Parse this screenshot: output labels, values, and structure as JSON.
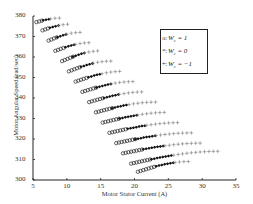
{
  "chart_data": {
    "type": "scatter",
    "title": "",
    "xlabel": "Motor Stator Current (A)",
    "ylabel": "Motor Angular Speed (rad/sec)",
    "xlim": [
      5,
      35
    ],
    "ylim": [
      300,
      380
    ],
    "xticks": [
      5,
      10,
      15,
      20,
      25,
      30,
      35
    ],
    "yticks": [
      300,
      310,
      320,
      330,
      340,
      350,
      360,
      370,
      380
    ],
    "grid": false,
    "legend_position": "upper right (inside)",
    "legend": [
      {
        "label": "W_c = 1",
        "marker": "circle-open"
      },
      {
        "label": "W_c = 0",
        "marker": "filled"
      },
      {
        "label": "W_c = -1",
        "marker": "plus"
      }
    ],
    "bands_note": "Each band = one speed level; points go left→right: circles (W_c=1), filled (W_c=0), plus (W_c=-1)",
    "bands": [
      {
        "y_start": 377,
        "x_start": 5.5,
        "circle": [
          5.5,
          6.5
        ],
        "filled": [
          6.5,
          7.6
        ],
        "plus": [
          7.6,
          9.0
        ],
        "rise": 2
      },
      {
        "y_start": 373,
        "x_start": 6.4,
        "circle": [
          6.4,
          7.5
        ],
        "filled": [
          7.5,
          8.8
        ],
        "plus": [
          8.8,
          10.5
        ],
        "rise": 3
      },
      {
        "y_start": 368,
        "x_start": 7.3,
        "circle": [
          7.3,
          8.6
        ],
        "filled": [
          8.6,
          10.0
        ],
        "plus": [
          10.0,
          12.0
        ],
        "rise": 4
      },
      {
        "y_start": 363,
        "x_start": 8.3,
        "circle": [
          8.3,
          9.8
        ],
        "filled": [
          9.8,
          11.3
        ],
        "plus": [
          11.3,
          13.5
        ],
        "rise": 4
      },
      {
        "y_start": 358,
        "x_start": 9.3,
        "circle": [
          9.3,
          10.9
        ],
        "filled": [
          10.9,
          12.6
        ],
        "plus": [
          12.6,
          15.0
        ],
        "rise": 5
      },
      {
        "y_start": 353,
        "x_start": 10.3,
        "circle": [
          10.3,
          12.1
        ],
        "filled": [
          12.1,
          13.9
        ],
        "plus": [
          13.9,
          16.5
        ],
        "rise": 5
      },
      {
        "y_start": 348,
        "x_start": 11.3,
        "circle": [
          11.3,
          13.2
        ],
        "filled": [
          13.2,
          15.2
        ],
        "plus": [
          15.2,
          18.2
        ],
        "rise": 5
      },
      {
        "y_start": 343,
        "x_start": 12.3,
        "circle": [
          12.3,
          14.4
        ],
        "filled": [
          14.4,
          16.5
        ],
        "plus": [
          16.5,
          19.8
        ],
        "rise": 5
      },
      {
        "y_start": 338,
        "x_start": 13.3,
        "circle": [
          13.3,
          15.5
        ],
        "filled": [
          15.5,
          17.8
        ],
        "plus": [
          17.8,
          21.5
        ],
        "rise": 5
      },
      {
        "y_start": 333,
        "x_start": 14.3,
        "circle": [
          14.3,
          16.7
        ],
        "filled": [
          16.7,
          19.2
        ],
        "plus": [
          19.2,
          23.2
        ],
        "rise": 5
      },
      {
        "y_start": 328,
        "x_start": 15.3,
        "circle": [
          15.3,
          17.8
        ],
        "filled": [
          17.8,
          20.5
        ],
        "plus": [
          20.5,
          25.0
        ],
        "rise": 5
      },
      {
        "y_start": 323,
        "x_start": 16.3,
        "circle": [
          16.3,
          19.0
        ],
        "filled": [
          19.0,
          21.8
        ],
        "plus": [
          21.8,
          26.8
        ],
        "rise": 5
      },
      {
        "y_start": 318,
        "x_start": 17.3,
        "circle": [
          17.3,
          20.1
        ],
        "filled": [
          20.1,
          23.2
        ],
        "plus": [
          23.2,
          28.6
        ],
        "rise": 5
      },
      {
        "y_start": 313,
        "x_start": 18.3,
        "circle": [
          18.3,
          21.3
        ],
        "filled": [
          21.3,
          24.5
        ],
        "plus": [
          24.5,
          30.0
        ],
        "rise": 5
      },
      {
        "y_start": 308,
        "x_start": 19.5,
        "circle": [
          19.5,
          22.5
        ],
        "filled": [
          22.5,
          25.8
        ],
        "plus": [
          25.8,
          32.5
        ],
        "rise": 6
      },
      {
        "y_start": 304,
        "x_start": 20.5,
        "circle": [
          20.5,
          23.2
        ],
        "filled": [
          23.2,
          26.0
        ],
        "plus": [
          26.0,
          28.0
        ],
        "rise": 5
      }
    ]
  },
  "axes": {
    "xlabel": "Motor Stator Current (A)",
    "ylabel": "Motor Angular Speed (rad/sec)",
    "xtick_labels": [
      "5",
      "10",
      "15",
      "20",
      "25",
      "30",
      "35"
    ],
    "ytick_labels": [
      "300",
      "310",
      "320",
      "330",
      "340",
      "350",
      "360",
      "370",
      "380"
    ]
  },
  "legend": {
    "items": [
      {
        "marker": "o:",
        "label": "Wₒ = 1",
        "text": "W",
        "sub": "c",
        "rest": " = 1"
      },
      {
        "marker": "*:",
        "label": "Wₒ = 0",
        "text": "W",
        "sub": "c",
        "rest": " = 0"
      },
      {
        "marker": "+:",
        "label": "Wₒ = −1",
        "text": "W",
        "sub": "c",
        "rest": " = −1"
      }
    ]
  }
}
